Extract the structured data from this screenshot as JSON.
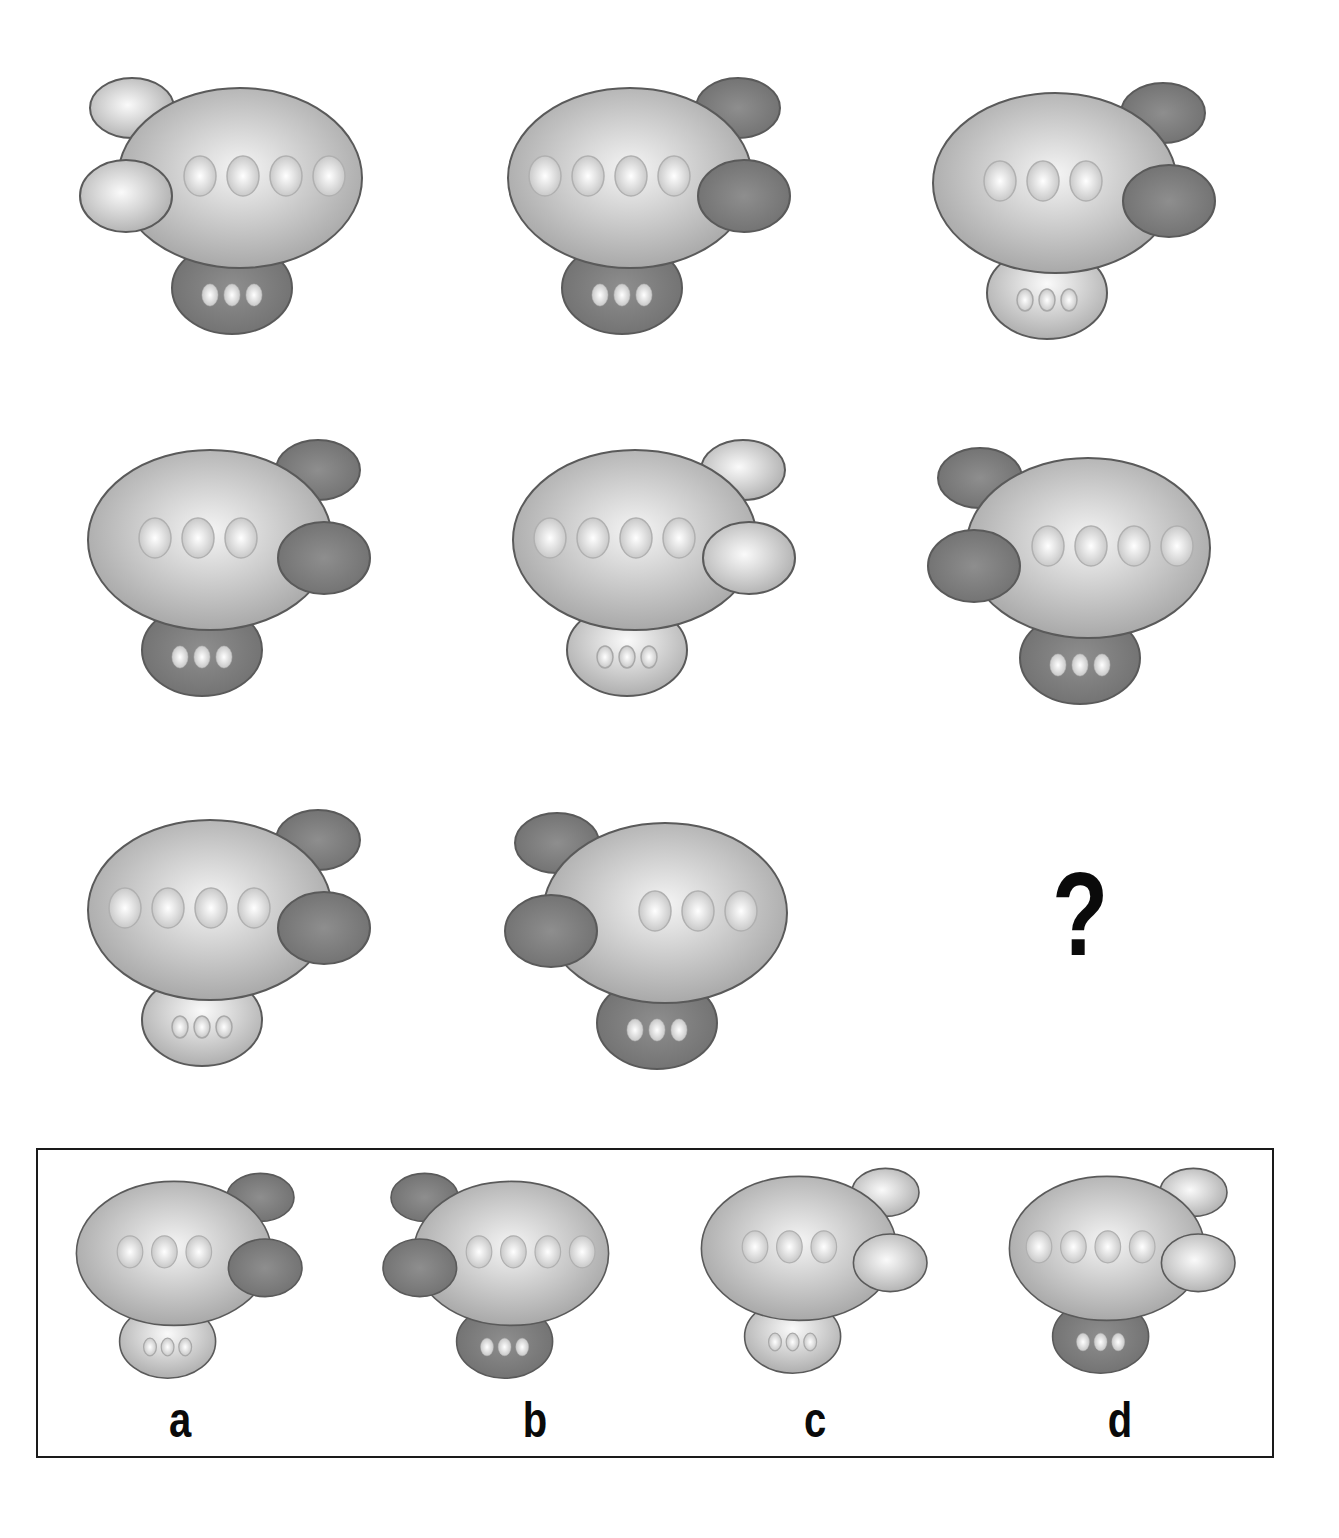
{
  "puzzle": {
    "question_mark": "?",
    "colors": {
      "body_light": "#f4f4f4",
      "body_dark": "#9b9b9b",
      "pod_dark_light": "#8e8e8e",
      "pod_dark_dark": "#6c6c6c",
      "pod_light_light": "#fafafa",
      "pod_light_dark": "#a8a8a8",
      "outline": "#5a5a5a",
      "window_light": "#ffffff",
      "window_dark": "#b9b9b9"
    },
    "grid": [
      {
        "id": "fig-1",
        "pods_side": "left",
        "pods_shade": "light",
        "windows": 4,
        "base_shade": "dark",
        "base_windows": 3
      },
      {
        "id": "fig-2",
        "pods_side": "right",
        "pods_shade": "dark",
        "windows": 4,
        "base_shade": "dark",
        "base_windows": 3
      },
      {
        "id": "fig-3",
        "pods_side": "right",
        "pods_shade": "dark",
        "windows": 3,
        "base_shade": "light",
        "base_windows": 3
      },
      {
        "id": "fig-4",
        "pods_side": "right",
        "pods_shade": "dark",
        "windows": 3,
        "base_shade": "dark",
        "base_windows": 3
      },
      {
        "id": "fig-5",
        "pods_side": "right",
        "pods_shade": "light",
        "windows": 4,
        "base_shade": "light",
        "base_windows": 3
      },
      {
        "id": "fig-6",
        "pods_side": "left",
        "pods_shade": "dark",
        "windows": 4,
        "base_shade": "dark",
        "base_windows": 3
      },
      {
        "id": "fig-7",
        "pods_side": "right",
        "pods_shade": "dark",
        "windows": 4,
        "base_shade": "light",
        "base_windows": 3
      },
      {
        "id": "fig-8",
        "pods_side": "left",
        "pods_shade": "dark",
        "windows": 3,
        "base_shade": "dark",
        "base_windows": 3
      },
      {
        "id": "fig-9",
        "missing": true
      }
    ],
    "options": [
      {
        "label": "a",
        "pods_side": "right",
        "pods_shade": "dark",
        "windows": 3,
        "base_shade": "light",
        "base_windows": 3
      },
      {
        "label": "b",
        "pods_side": "left",
        "pods_shade": "dark",
        "windows": 4,
        "base_shade": "dark",
        "base_windows": 3
      },
      {
        "label": "c",
        "pods_side": "right",
        "pods_shade": "light",
        "windows": 3,
        "base_shade": "light",
        "base_windows": 3
      },
      {
        "label": "d",
        "pods_side": "right",
        "pods_shade": "light",
        "windows": 4,
        "base_shade": "dark",
        "base_windows": 3
      }
    ]
  }
}
